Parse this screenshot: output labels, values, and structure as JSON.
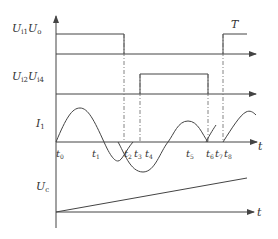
{
  "diagram": {
    "type": "timing-diagram",
    "labels": {
      "top_signal_main": "U",
      "top_signal_sub1": "i1",
      "top_signal_main2": "U",
      "top_signal_sub2": "o",
      "second_signal_main": "U",
      "second_signal_sub1": "i2",
      "second_signal_main2": "U",
      "second_signal_sub2": "i4",
      "current_main": "I",
      "current_sub": "1",
      "capacitor_main": "U",
      "capacitor_sub": "c",
      "period_label": "T",
      "time_axis": "t"
    },
    "time_marks": [
      {
        "main": "t",
        "sub": "0"
      },
      {
        "main": "t",
        "sub": "1"
      },
      {
        "main": "t",
        "sub": "2"
      },
      {
        "main": "t",
        "sub": "3"
      },
      {
        "main": "t",
        "sub": "4"
      },
      {
        "main": "t",
        "sub": "5"
      },
      {
        "main": "t",
        "sub": "6"
      },
      {
        "main": "t",
        "sub": "7"
      },
      {
        "main": "t",
        "sub": "8"
      }
    ],
    "colors": {
      "line": "#444444",
      "dashed": "#666666",
      "text": "#333333",
      "background": "#ffffff"
    }
  }
}
